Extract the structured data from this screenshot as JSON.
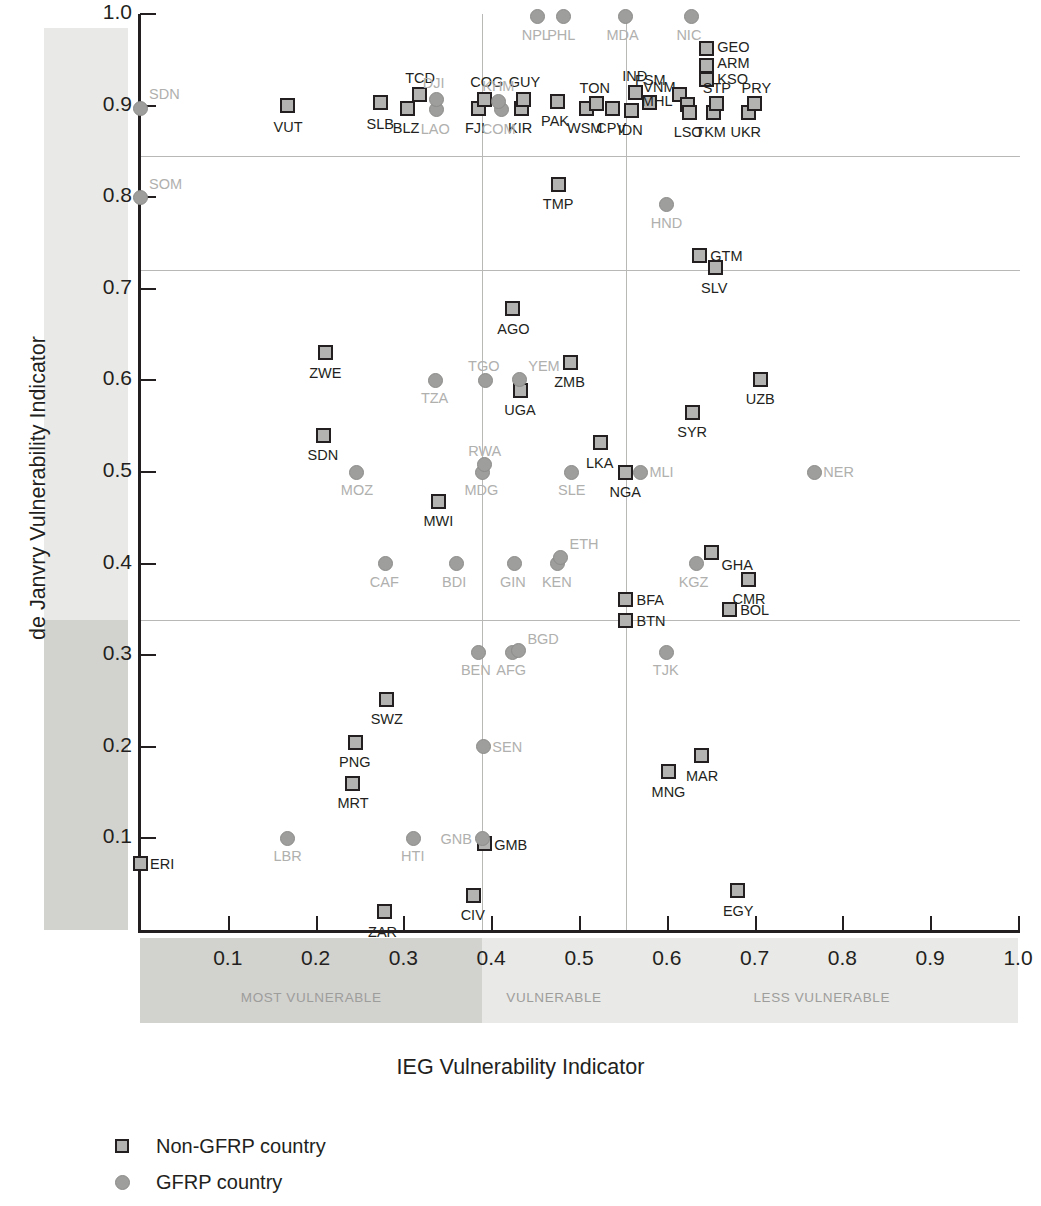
{
  "chart_data": {
    "type": "scatter",
    "title": "",
    "xlabel": "IEG Vulnerability Indicator",
    "ylabel": "de Janvry Vulnerability Indicator",
    "xlim": [
      0,
      1.0
    ],
    "ylim": [
      0,
      1.0
    ],
    "grid": false,
    "xticks": [
      "0.1",
      "0.2",
      "0.3",
      "0.4",
      "0.5",
      "0.6",
      "0.7",
      "0.8",
      "0.9",
      "1.0"
    ],
    "xtick_values": [
      0.1,
      0.2,
      0.3,
      0.4,
      0.5,
      0.6,
      0.7,
      0.8,
      0.9,
      1.0
    ],
    "yticks": [
      "0.1",
      "0.2",
      "0.3",
      "0.4",
      "0.5",
      "0.6",
      "0.7",
      "0.8",
      "0.9",
      "1.0"
    ],
    "ytick_values": [
      0.1,
      0.2,
      0.3,
      0.4,
      0.5,
      0.6,
      0.7,
      0.8,
      0.9,
      1.0
    ],
    "reference_lines": {
      "horizontal": [
        0.845,
        0.72,
        0.338
      ],
      "vertical": [
        0.39,
        0.553
      ]
    },
    "x_bands": [
      {
        "label": "MOST VULNERABLE",
        "from": 0.0,
        "to": 0.39,
        "shade": "dark"
      },
      {
        "label": "VULNERABLE",
        "from": 0.39,
        "to": 0.553,
        "shade": "light"
      },
      {
        "label": "LESS VULNERABLE",
        "from": 0.553,
        "to": 1.0,
        "shade": "light"
      }
    ],
    "y_bands": [
      {
        "label": "SOMEWHAT VULNERABLE",
        "from": 0.72,
        "to": 0.985,
        "shade": "light"
      },
      {
        "label": "HIGHLY VULNERABLE",
        "from": 0.338,
        "to": 0.72,
        "shade": "light"
      },
      {
        "label": "MOST VULNERABLE",
        "from": 0.0,
        "to": 0.338,
        "shade": "dark"
      }
    ],
    "legend": {
      "position": "below-plot",
      "entries": [
        {
          "marker": "square",
          "label": "Non-GFRP country"
        },
        {
          "marker": "circle",
          "label": "GFRP country"
        }
      ]
    },
    "series": [
      {
        "name": "Non-GFRP country",
        "marker": "square",
        "points": [
          {
            "code": "VUT",
            "x": 0.168,
            "y": 0.9,
            "lx": -14,
            "ly": 14
          },
          {
            "code": "SLB",
            "x": 0.274,
            "y": 0.903,
            "lx": -14,
            "ly": 14
          },
          {
            "code": "TCD",
            "x": 0.318,
            "y": 0.912,
            "lx": -14,
            "ly": -24
          },
          {
            "code": "BLZ",
            "x": 0.305,
            "y": 0.897,
            "lx": -15,
            "ly": 13
          },
          {
            "code": "FJI",
            "x": 0.385,
            "y": 0.897,
            "lx": -13,
            "ly": 13
          },
          {
            "code": "COG",
            "x": 0.392,
            "y": 0.907,
            "lx": -14,
            "ly": -24
          },
          {
            "code": "KIR",
            "x": 0.434,
            "y": 0.897,
            "lx": -13,
            "ly": 13
          },
          {
            "code": "GUY",
            "x": 0.437,
            "y": 0.907,
            "lx": -15,
            "ly": -24
          },
          {
            "code": "PAK",
            "x": 0.475,
            "y": 0.905,
            "lx": -16,
            "ly": 13
          },
          {
            "code": "WSM",
            "x": 0.508,
            "y": 0.897,
            "lx": -19,
            "ly": 13
          },
          {
            "code": "TON",
            "x": 0.52,
            "y": 0.902,
            "lx": -17,
            "ly": -23
          },
          {
            "code": "CPV",
            "x": 0.538,
            "y": 0.897,
            "lx": -16,
            "ly": 13
          },
          {
            "code": "IDN",
            "x": 0.56,
            "y": 0.895,
            "lx": -14,
            "ly": 13
          },
          {
            "code": "IND",
            "x": 0.564,
            "y": 0.914,
            "lx": -13,
            "ly": -24
          },
          {
            "code": "VNM",
            "x": 0.58,
            "y": 0.903,
            "lx": -6,
            "ly": -23
          },
          {
            "code": "FSM",
            "x": 0.614,
            "y": 0.912,
            "lx": -44,
            "ly": -22
          },
          {
            "code": "MHL",
            "x": 0.624,
            "y": 0.901,
            "lx": -46,
            "ly": -11
          },
          {
            "code": "LSO",
            "x": 0.626,
            "y": 0.893,
            "lx": -16,
            "ly": 13
          },
          {
            "code": "GEO",
            "x": 0.645,
            "y": 0.962,
            "lx": 11,
            "ly": -9
          },
          {
            "code": "ARM",
            "x": 0.645,
            "y": 0.944,
            "lx": 11,
            "ly": -9
          },
          {
            "code": "KSO",
            "x": 0.645,
            "y": 0.928,
            "lx": 11,
            "ly": -8
          },
          {
            "code": "TKM",
            "x": 0.653,
            "y": 0.893,
            "lx": -18,
            "ly": 13
          },
          {
            "code": "STP",
            "x": 0.657,
            "y": 0.902,
            "lx": -14,
            "ly": -23
          },
          {
            "code": "UKR",
            "x": 0.693,
            "y": 0.893,
            "lx": -18,
            "ly": 13
          },
          {
            "code": "PRY",
            "x": 0.7,
            "y": 0.902,
            "lx": -13,
            "ly": -23
          },
          {
            "code": "TMP",
            "x": 0.477,
            "y": 0.814,
            "lx": -16,
            "ly": 13
          },
          {
            "code": "GTM",
            "x": 0.637,
            "y": 0.736,
            "lx": 11,
            "ly": -7
          },
          {
            "code": "SLV",
            "x": 0.655,
            "y": 0.723,
            "lx": -14,
            "ly": 13
          },
          {
            "code": "AGO",
            "x": 0.424,
            "y": 0.678,
            "lx": -15,
            "ly": 13
          },
          {
            "code": "ZWE",
            "x": 0.211,
            "y": 0.63,
            "lx": -16,
            "ly": 13
          },
          {
            "code": "ZMB",
            "x": 0.49,
            "y": 0.62,
            "lx": -16,
            "ly": 13
          },
          {
            "code": "UZB",
            "x": 0.707,
            "y": 0.601,
            "lx": -15,
            "ly": 13
          },
          {
            "code": "UGA",
            "x": 0.433,
            "y": 0.589,
            "lx": -16,
            "ly": 13
          },
          {
            "code": "SYR",
            "x": 0.629,
            "y": 0.565,
            "lx": -15,
            "ly": 13
          },
          {
            "code": "SDN",
            "x": 0.209,
            "y": 0.54,
            "lx": -16,
            "ly": 13
          },
          {
            "code": "LKA",
            "x": 0.525,
            "y": 0.532,
            "lx": -15,
            "ly": 13
          },
          {
            "code": "NGA",
            "x": 0.553,
            "y": 0.5,
            "lx": -16,
            "ly": 13
          },
          {
            "code": "MWI",
            "x": 0.34,
            "y": 0.468,
            "lx": -15,
            "ly": 13
          },
          {
            "code": "GHA",
            "x": 0.651,
            "y": 0.412,
            "lx": 10,
            "ly": 5
          },
          {
            "code": "CMR",
            "x": 0.693,
            "y": 0.383,
            "lx": -16,
            "ly": 13
          },
          {
            "code": "BFA",
            "x": 0.553,
            "y": 0.361,
            "lx": 11,
            "ly": -6
          },
          {
            "code": "BOL",
            "x": 0.671,
            "y": 0.35,
            "lx": 11,
            "ly": -6
          },
          {
            "code": "BTN",
            "x": 0.553,
            "y": 0.338,
            "lx": 11,
            "ly": -6
          },
          {
            "code": "SWZ",
            "x": 0.281,
            "y": 0.252,
            "lx": -16,
            "ly": 13
          },
          {
            "code": "PNG",
            "x": 0.245,
            "y": 0.205,
            "lx": -16,
            "ly": 13
          },
          {
            "code": "MAR",
            "x": 0.64,
            "y": 0.19,
            "lx": -16,
            "ly": 13
          },
          {
            "code": "MNG",
            "x": 0.602,
            "y": 0.173,
            "lx": -17,
            "ly": 13
          },
          {
            "code": "MRT",
            "x": 0.242,
            "y": 0.16,
            "lx": -15,
            "ly": 13
          },
          {
            "code": "GMB",
            "x": 0.392,
            "y": 0.094,
            "lx": 10,
            "ly": -6
          },
          {
            "code": "ERI",
            "x": 0.0,
            "y": 0.073,
            "lx": 10,
            "ly": -6
          },
          {
            "code": "EGY",
            "x": 0.681,
            "y": 0.043,
            "lx": -15,
            "ly": 13
          },
          {
            "code": "CIV",
            "x": 0.38,
            "y": 0.038,
            "lx": -13,
            "ly": 13
          },
          {
            "code": "ZAR",
            "x": 0.278,
            "y": 0.02,
            "lx": -16,
            "ly": 13
          }
        ]
      },
      {
        "name": "GFRP country",
        "marker": "circle",
        "points": [
          {
            "code": "NPL",
            "x": 0.453,
            "y": 0.997,
            "lx": -16,
            "ly": 11
          },
          {
            "code": "PHL",
            "x": 0.482,
            "y": 0.997,
            "lx": -16,
            "ly": 11
          },
          {
            "code": "MDA",
            "x": 0.553,
            "y": 0.997,
            "lx": -19,
            "ly": 11
          },
          {
            "code": "NIC",
            "x": 0.628,
            "y": 0.997,
            "lx": -15,
            "ly": 11
          },
          {
            "code": "SDN",
            "x": 0.0,
            "y": 0.897,
            "lx": 9,
            "ly": -21
          },
          {
            "code": "LAO",
            "x": 0.338,
            "y": 0.896,
            "lx": -16,
            "ly": 13
          },
          {
            "code": "DJI",
            "x": 0.338,
            "y": 0.907,
            "lx": -14,
            "ly": -23
          },
          {
            "code": "COM",
            "x": 0.412,
            "y": 0.896,
            "lx": -20,
            "ly": 13
          },
          {
            "code": "KHM",
            "x": 0.408,
            "y": 0.905,
            "lx": -16,
            "ly": -22
          },
          {
            "code": "SOM",
            "x": 0.0,
            "y": 0.8,
            "lx": 9,
            "ly": -20
          },
          {
            "code": "HND",
            "x": 0.6,
            "y": 0.792,
            "lx": -16,
            "ly": 11
          },
          {
            "code": "TZA",
            "x": 0.337,
            "y": 0.6,
            "lx": -15,
            "ly": 11
          },
          {
            "code": "TGO",
            "x": 0.393,
            "y": 0.6,
            "lx": -17,
            "ly": -21
          },
          {
            "code": "YEM",
            "x": 0.432,
            "y": 0.601,
            "lx": 9,
            "ly": -20
          },
          {
            "code": "MOZ",
            "x": 0.247,
            "y": 0.5,
            "lx": -16,
            "ly": 11
          },
          {
            "code": "MDG",
            "x": 0.39,
            "y": 0.5,
            "lx": -18,
            "ly": 11
          },
          {
            "code": "RWA",
            "x": 0.392,
            "y": 0.508,
            "lx": -16,
            "ly": -21
          },
          {
            "code": "SLE",
            "x": 0.492,
            "y": 0.5,
            "lx": -14,
            "ly": 11
          },
          {
            "code": "MLI",
            "x": 0.57,
            "y": 0.5,
            "lx": 9,
            "ly": -7
          },
          {
            "code": "NER",
            "x": 0.768,
            "y": 0.5,
            "lx": 9,
            "ly": -7
          },
          {
            "code": "CAF",
            "x": 0.28,
            "y": 0.4,
            "lx": -16,
            "ly": 11
          },
          {
            "code": "BDI",
            "x": 0.36,
            "y": 0.4,
            "lx": -14,
            "ly": 11
          },
          {
            "code": "GIN",
            "x": 0.426,
            "y": 0.4,
            "lx": -14,
            "ly": 11
          },
          {
            "code": "KEN",
            "x": 0.476,
            "y": 0.4,
            "lx": -16,
            "ly": 11
          },
          {
            "code": "ETH",
            "x": 0.479,
            "y": 0.407,
            "lx": 9,
            "ly": -20
          },
          {
            "code": "KGZ",
            "x": 0.634,
            "y": 0.4,
            "lx": -18,
            "ly": 11
          },
          {
            "code": "BEN",
            "x": 0.386,
            "y": 0.303,
            "lx": -18,
            "ly": 11
          },
          {
            "code": "AFG",
            "x": 0.424,
            "y": 0.303,
            "lx": -16,
            "ly": 11
          },
          {
            "code": "BGD",
            "x": 0.431,
            "y": 0.305,
            "lx": 9,
            "ly": -19
          },
          {
            "code": "TJK",
            "x": 0.6,
            "y": 0.303,
            "lx": -14,
            "ly": 11
          },
          {
            "code": "SEN",
            "x": 0.391,
            "y": 0.2,
            "lx": 9,
            "ly": -7
          },
          {
            "code": "LBR",
            "x": 0.168,
            "y": 0.1,
            "lx": -14,
            "ly": 11
          },
          {
            "code": "HTI",
            "x": 0.311,
            "y": 0.1,
            "lx": -12,
            "ly": 11
          },
          {
            "code": "GNB",
            "x": 0.39,
            "y": 0.1,
            "lx": -42,
            "ly": -6
          }
        ]
      }
    ]
  }
}
